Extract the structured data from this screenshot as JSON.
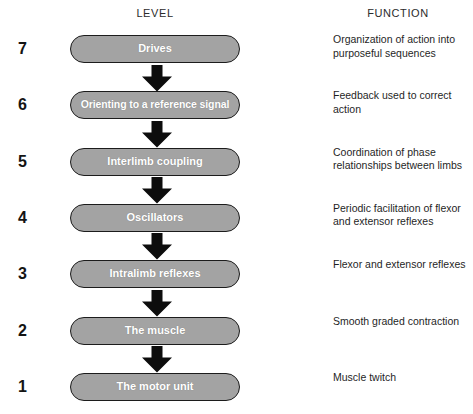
{
  "headers": {
    "level": "LEVEL",
    "function": "FUNCTION"
  },
  "colors": {
    "box_fill": "#a3a3a3",
    "box_border": "#1c1c1c",
    "box_text": "#ffffff",
    "arrow": "#0d0d0d",
    "page_background": "#ffffff",
    "body_text": "#1f1f1f"
  },
  "rows": [
    {
      "level": "7",
      "label": "Drives",
      "function": "Organization of action into purposeful sequences"
    },
    {
      "level": "6",
      "label": "Orienting to a reference signal",
      "function": "Feedback used to correct action"
    },
    {
      "level": "5",
      "label": "Interlimb coupling",
      "function": "Coordination of phase relationships between limbs"
    },
    {
      "level": "4",
      "label": "Oscillators",
      "function": "Periodic facilitation of flexor and extensor reflexes"
    },
    {
      "level": "3",
      "label": "Intralimb reflexes",
      "function": "Flexor and extensor reflexes"
    },
    {
      "level": "2",
      "label": "The muscle",
      "function": "Smooth graded contraction"
    },
    {
      "level": "1",
      "label": "The motor unit",
      "function": "Muscle twitch"
    }
  ]
}
